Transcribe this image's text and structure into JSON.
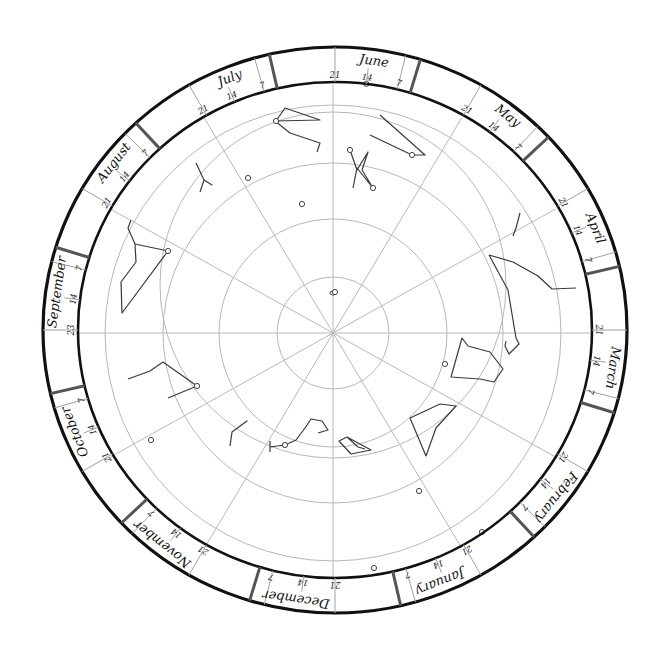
{
  "geometry": {
    "center": [
      335,
      330
    ],
    "outer_ring": {
      "rx": 292,
      "ry": 283
    },
    "inner_ring": {
      "rx": 257,
      "ry": 248
    },
    "grid_circles": [
      56,
      114,
      170,
      228
    ],
    "horizon_circle": {
      "cx": 333,
      "cy": 285,
      "r": 173
    },
    "radial_lines": 12
  },
  "colors": {
    "ring": "#111111",
    "grid": "#b8b8b8",
    "constellation": "#3a3a3a",
    "month_divider": "#555555"
  },
  "months": [
    {
      "name": "June",
      "angle": 0
    },
    {
      "name": "May",
      "angle": 30
    },
    {
      "name": "April",
      "angle": 60
    },
    {
      "name": "March",
      "angle": 90
    },
    {
      "name": "February",
      "angle": 120
    },
    {
      "name": "January",
      "angle": 150
    },
    {
      "name": "December",
      "angle": 180
    },
    {
      "name": "November",
      "angle": 210
    },
    {
      "name": "October",
      "angle": 240
    },
    {
      "name": "September",
      "angle": 270
    },
    {
      "name": "August",
      "angle": 300
    },
    {
      "name": "July",
      "angle": 330
    }
  ],
  "day_marks": [
    "21",
    "14",
    "7"
  ],
  "september_start_label": "23",
  "constellations": [
    {
      "name": "north-top-left",
      "points": [
        [
          276,
          121
        ],
        [
          285,
          108
        ],
        [
          320,
          120
        ],
        [
          275,
          121
        ],
        [
          290,
          133
        ],
        [
          320,
          143
        ],
        [
          317,
          152
        ]
      ]
    },
    {
      "name": "north-top-right",
      "points": [
        [
          380,
          115
        ],
        [
          425,
          155
        ],
        [
          412,
          155
        ],
        [
          370,
          135
        ]
      ]
    },
    {
      "name": "north-center",
      "points": [
        [
          350,
          150
        ],
        [
          357,
          170
        ],
        [
          368,
          152
        ],
        [
          362,
          170
        ],
        [
          373,
          188
        ],
        [
          357,
          168
        ],
        [
          353,
          188
        ]
      ]
    },
    {
      "name": "upper-left-y",
      "points": [
        [
          196,
          163
        ],
        [
          204,
          180
        ],
        [
          212,
          185
        ],
        [
          204,
          180
        ],
        [
          200,
          192
        ]
      ]
    },
    {
      "name": "west-big",
      "points": [
        [
          131,
          220
        ],
        [
          128,
          228
        ],
        [
          135,
          244
        ],
        [
          168,
          251
        ],
        [
          135,
          244
        ],
        [
          136,
          262
        ],
        [
          121,
          282
        ],
        [
          122,
          313
        ],
        [
          168,
          251
        ]
      ]
    },
    {
      "name": "northeast-small",
      "points": [
        [
          520,
          213
        ],
        [
          516,
          228
        ],
        [
          513,
          236
        ]
      ]
    },
    {
      "name": "east-long",
      "points": [
        [
          489,
          255
        ],
        [
          513,
          262
        ],
        [
          538,
          276
        ],
        [
          552,
          289
        ],
        [
          576,
          288
        ]
      ]
    },
    {
      "name": "east-vertical",
      "points": [
        [
          489,
          255
        ],
        [
          508,
          290
        ],
        [
          516,
          338
        ],
        [
          519,
          344
        ],
        [
          509,
          354
        ],
        [
          505,
          346
        ],
        [
          506,
          341
        ]
      ]
    },
    {
      "name": "east-square",
      "points": [
        [
          462,
          338
        ],
        [
          468,
          346
        ],
        [
          490,
          352
        ],
        [
          503,
          369
        ],
        [
          494,
          382
        ],
        [
          480,
          379
        ],
        [
          451,
          377
        ],
        [
          462,
          338
        ]
      ]
    },
    {
      "name": "southeast-kite",
      "points": [
        [
          410,
          418
        ],
        [
          440,
          404
        ],
        [
          456,
          406
        ],
        [
          436,
          428
        ],
        [
          426,
          456
        ],
        [
          410,
          418
        ]
      ]
    },
    {
      "name": "southwest-bent",
      "points": [
        [
          128,
          379
        ],
        [
          150,
          371
        ],
        [
          163,
          362
        ],
        [
          197,
          386
        ],
        [
          168,
          398
        ]
      ]
    },
    {
      "name": "south-left-y",
      "points": [
        [
          230,
          446
        ],
        [
          232,
          432
        ],
        [
          247,
          421
        ],
        [
          232,
          432
        ]
      ]
    },
    {
      "name": "south-center-hook",
      "points": [
        [
          270,
          447
        ],
        [
          285,
          445
        ],
        [
          296,
          440
        ],
        [
          305,
          428
        ],
        [
          311,
          419
        ],
        [
          322,
          421
        ],
        [
          328,
          430
        ],
        [
          318,
          433
        ]
      ]
    },
    {
      "name": "south-cross-tick",
      "points": [
        [
          270,
          441
        ],
        [
          270,
          452
        ]
      ]
    },
    {
      "name": "south-quad",
      "points": [
        [
          339,
          441
        ],
        [
          347,
          437
        ],
        [
          371,
          450
        ],
        [
          351,
          454
        ],
        [
          339,
          441
        ],
        [
          347,
          437
        ],
        [
          358,
          447
        ],
        [
          365,
          449
        ]
      ]
    }
  ],
  "stars": [
    [
      276,
      121
    ],
    [
      350,
      150
    ],
    [
      412,
      155
    ],
    [
      373,
      188
    ],
    [
      248,
      178
    ],
    [
      302,
      204
    ],
    [
      168,
      251
    ],
    [
      335,
      292
    ],
    [
      445,
      364
    ],
    [
      197,
      386
    ],
    [
      151,
      440
    ],
    [
      285,
      445
    ],
    [
      419,
      491
    ],
    [
      482,
      532
    ],
    [
      374,
      568
    ]
  ]
}
